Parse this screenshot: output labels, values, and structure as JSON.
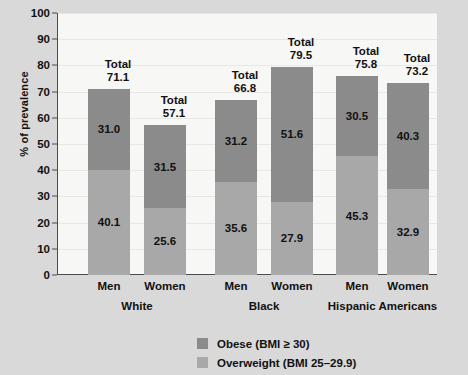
{
  "chart_data": {
    "type": "bar",
    "subtype": "stacked",
    "title": "",
    "xlabel": "",
    "ylabel": "% of prevalence",
    "ylim": [
      0,
      100
    ],
    "ytick_step": 10,
    "yticks": [
      100,
      90,
      80,
      70,
      60,
      50,
      40,
      30,
      20,
      10,
      0
    ],
    "grid": true,
    "legend_position": "bottom",
    "categories": [
      "Men",
      "Women",
      "Men",
      "Women",
      "Men",
      "Women"
    ],
    "groups": [
      {
        "name": "White",
        "categories": [
          "Men",
          "Women"
        ]
      },
      {
        "name": "Black",
        "categories": [
          "Men",
          "Women"
        ]
      },
      {
        "name": "Hispanic Americans",
        "categories": [
          "Men",
          "Women"
        ]
      }
    ],
    "series": [
      {
        "name": "Obese (BMI ≥ 30)",
        "color": "#8b8b8b",
        "values": [
          31.0,
          31.5,
          31.2,
          51.6,
          30.5,
          40.3
        ]
      },
      {
        "name": "Overweight (BMI 25–29.9)",
        "color": "#a8a8a8",
        "values": [
          40.1,
          25.6,
          35.6,
          27.9,
          45.3,
          32.9
        ]
      }
    ],
    "totals": [
      71.1,
      57.1,
      66.8,
      79.5,
      75.8,
      73.2
    ],
    "total_prefix": "Total",
    "bars": [
      {
        "group": "White",
        "sex": "Men",
        "obese": 31.0,
        "overweight": 40.1,
        "total": 71.1
      },
      {
        "group": "White",
        "sex": "Women",
        "obese": 31.5,
        "overweight": 25.6,
        "total": 57.1
      },
      {
        "group": "Black",
        "sex": "Men",
        "obese": 31.2,
        "overweight": 35.6,
        "total": 66.8
      },
      {
        "group": "Black",
        "sex": "Women",
        "obese": 51.6,
        "overweight": 27.9,
        "total": 79.5
      },
      {
        "group": "Hispanic Americans",
        "sex": "Men",
        "obese": 30.5,
        "overweight": 45.3,
        "total": 75.8
      },
      {
        "group": "Hispanic Americans",
        "sex": "Women",
        "obese": 40.3,
        "overweight": 32.9,
        "total": 73.2
      }
    ],
    "legend": [
      {
        "label": "Obese (BMI ≥ 30)",
        "color": "#8b8b8b"
      },
      {
        "label": "Overweight (BMI 25–29.9)",
        "color": "#a8a8a8"
      }
    ]
  },
  "colors": {
    "page_background": "#d9d9d9",
    "plot_background": "#f7f7f6",
    "axis": "#4c4c4c",
    "gridline": "#e7e7e4",
    "obese": "#8b8b8b",
    "overweight": "#a8a8a8",
    "text": "#111111"
  }
}
